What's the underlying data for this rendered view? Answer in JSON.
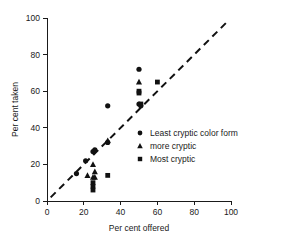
{
  "chart_data": {
    "type": "scatter",
    "title": "",
    "xlabel": "Per cent offered",
    "ylabel": "Per cent taken",
    "xlim": [
      0,
      100
    ],
    "ylim": [
      0,
      100
    ],
    "xticks": [
      0,
      20,
      40,
      60,
      80,
      100
    ],
    "yticks": [
      0,
      20,
      40,
      60,
      80,
      100
    ],
    "xticklabels": [
      "0",
      "20",
      "40",
      "60",
      "80",
      "100"
    ],
    "yticklabels": [
      "0",
      "20",
      "40",
      "60",
      "80",
      "100"
    ],
    "grid": false,
    "legend_position": "center-right",
    "reference_line": {
      "label": "1:1 line",
      "style": "dashed",
      "x": [
        2,
        99
      ],
      "y": [
        2,
        99
      ]
    },
    "series": [
      {
        "name": "Least cryptic color form",
        "marker": "circle",
        "color": "#111111",
        "points": [
          {
            "x": 16,
            "y": 15
          },
          {
            "x": 21,
            "y": 22
          },
          {
            "x": 25,
            "y": 27
          },
          {
            "x": 26,
            "y": 28
          },
          {
            "x": 33,
            "y": 52
          },
          {
            "x": 33,
            "y": 32
          },
          {
            "x": 50,
            "y": 72
          },
          {
            "x": 50,
            "y": 53
          },
          {
            "x": 51,
            "y": 52
          }
        ]
      },
      {
        "name": "more cryptic",
        "marker": "triangle",
        "color": "#111111",
        "points": [
          {
            "x": 22,
            "y": 14
          },
          {
            "x": 25,
            "y": 20
          },
          {
            "x": 25,
            "y": 13
          },
          {
            "x": 26,
            "y": 16
          },
          {
            "x": 26,
            "y": 13
          },
          {
            "x": 33,
            "y": 33
          },
          {
            "x": 50,
            "y": 65
          }
        ]
      },
      {
        "name": "Most cryptic",
        "marker": "square",
        "color": "#111111",
        "points": [
          {
            "x": 25,
            "y": 10
          },
          {
            "x": 25,
            "y": 8
          },
          {
            "x": 25,
            "y": 6
          },
          {
            "x": 33,
            "y": 14
          },
          {
            "x": 50,
            "y": 60
          },
          {
            "x": 50,
            "y": 59
          },
          {
            "x": 51,
            "y": 53
          },
          {
            "x": 60,
            "y": 65
          }
        ]
      }
    ],
    "legend": [
      {
        "label": "Least cryptic color form",
        "marker": "circle"
      },
      {
        "label": "more cryptic",
        "marker": "triangle"
      },
      {
        "label": "Most cryptic",
        "marker": "square"
      }
    ]
  }
}
